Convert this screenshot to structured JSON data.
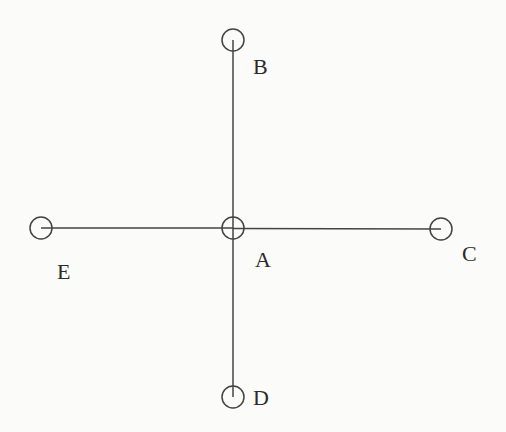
{
  "diagram": {
    "type": "cross-shaped node graph",
    "colors": {
      "background": "#fbfbfa",
      "stroke": "#444444",
      "label": "#2a2a2a"
    },
    "node_radius": 11,
    "nodes": [
      {
        "id": "A",
        "label": "A",
        "cx": 233,
        "cy": 228,
        "label_x": 255,
        "label_y": 249,
        "center_cross": true
      },
      {
        "id": "B",
        "label": "B",
        "cx": 233,
        "cy": 40,
        "label_x": 253,
        "label_y": 56
      },
      {
        "id": "C",
        "label": "C",
        "cx": 441,
        "cy": 229,
        "label_x": 462,
        "label_y": 243
      },
      {
        "id": "D",
        "label": "D",
        "cx": 233,
        "cy": 397,
        "label_x": 253,
        "label_y": 387
      },
      {
        "id": "E",
        "label": "E",
        "cx": 41,
        "cy": 228,
        "label_x": 57,
        "label_y": 261
      }
    ],
    "edges": [
      {
        "from": "A",
        "to": "B"
      },
      {
        "from": "A",
        "to": "C"
      },
      {
        "from": "A",
        "to": "D"
      },
      {
        "from": "A",
        "to": "E"
      }
    ]
  }
}
